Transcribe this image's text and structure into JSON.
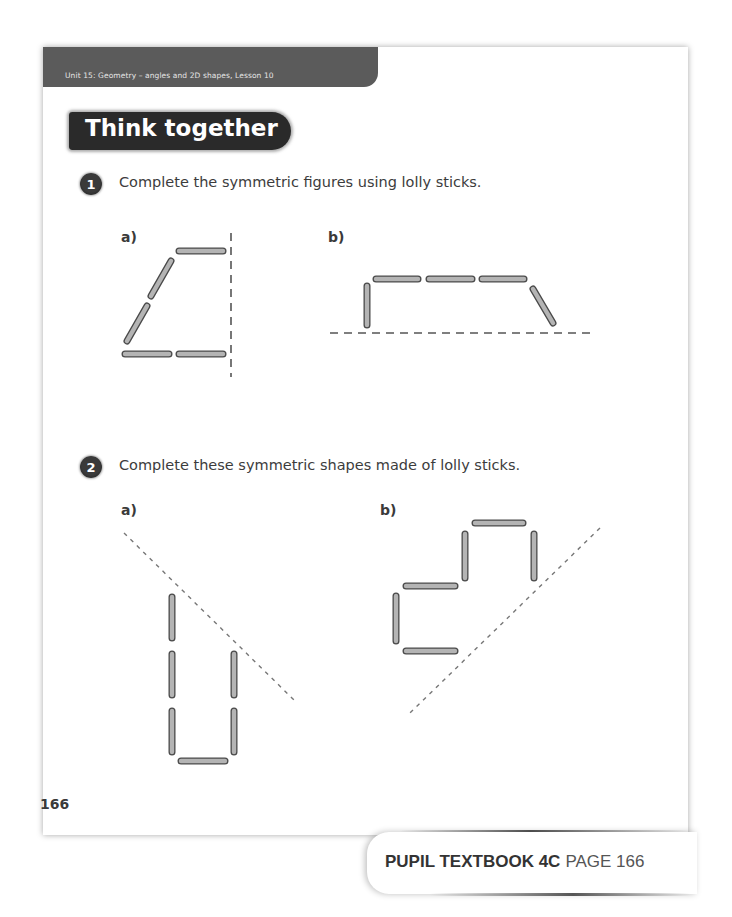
{
  "header": {
    "unit_label": "Unit 15: Geometry – angles and 2D shapes, Lesson 10",
    "section_title": "Think together"
  },
  "questions": [
    {
      "number": "1",
      "text": "Complete the symmetric figures using lolly sticks.",
      "parts": [
        {
          "label": "a)",
          "mirror_line": "vertical-dashed",
          "sticks": 6
        },
        {
          "label": "b)",
          "mirror_line": "horizontal-dashed",
          "sticks": 5
        }
      ]
    },
    {
      "number": "2",
      "text": "Complete these symmetric shapes made of lolly sticks.",
      "parts": [
        {
          "label": "a)",
          "mirror_line": "diagonal-dashed",
          "sticks": 6
        },
        {
          "label": "b)",
          "mirror_line": "diagonal-dashed",
          "sticks": 6
        }
      ]
    }
  ],
  "footer": {
    "page_number": "166",
    "book_label": "PUPIL TEXTBOOK 4C",
    "page_label": "PAGE 166"
  },
  "colors": {
    "stick_fill": "#b4b4b4",
    "stick_outline": "#4a4a4a",
    "band": "#5b5b5b",
    "badge": "#2a2a2a"
  }
}
